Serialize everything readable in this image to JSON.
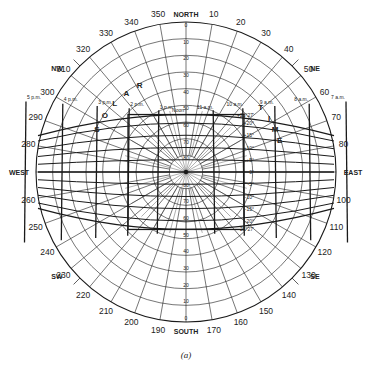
{
  "diagram": {
    "caption": "(a)",
    "center": [
      186,
      172
    ],
    "radius": 150,
    "compass": {
      "north": "NORTH",
      "south": "SOUTH",
      "east": "EAST",
      "west": "WEST",
      "ne": "NE",
      "nw": "NW",
      "se": "SE",
      "sw": "SW"
    },
    "azimuth_labels": [
      "10",
      "20",
      "30",
      "40",
      "50",
      "60",
      "70",
      "80",
      "100",
      "110",
      "120",
      "130",
      "140",
      "150",
      "160",
      "170",
      "190",
      "200",
      "210",
      "220",
      "230",
      "240",
      "250",
      "260",
      "280",
      "290",
      "300",
      "310",
      "320",
      "330",
      "340",
      "350"
    ],
    "altitude_labels_north": [
      "0",
      "10",
      "20",
      "30",
      "40",
      "50",
      "60",
      "70",
      "80"
    ],
    "altitude_labels_south": [
      "80",
      "70",
      "60",
      "50",
      "40",
      "30",
      "20",
      "10",
      "0"
    ],
    "declination_labels": [
      "+23°27'",
      "+20°",
      "+15°",
      "+10°",
      "+5°",
      "0°",
      "-5°",
      "-10°",
      "-15°",
      "-20°",
      "-23°27'"
    ],
    "solar_time_title": [
      "S",
      "O",
      "L",
      "A",
      "R",
      "T",
      "I",
      "M",
      "E"
    ],
    "hour_labels": [
      "5 p.m.",
      "4 p.m.",
      "3 p.m.",
      "2 p.m.",
      "1 p.m.",
      "Noon",
      "11 a.m.",
      "10 a.m.",
      "9 a.m.",
      "8 a.m.",
      "7 a.m."
    ],
    "colors": {
      "line": "#1a1a1a",
      "background": "#ffffff"
    }
  }
}
